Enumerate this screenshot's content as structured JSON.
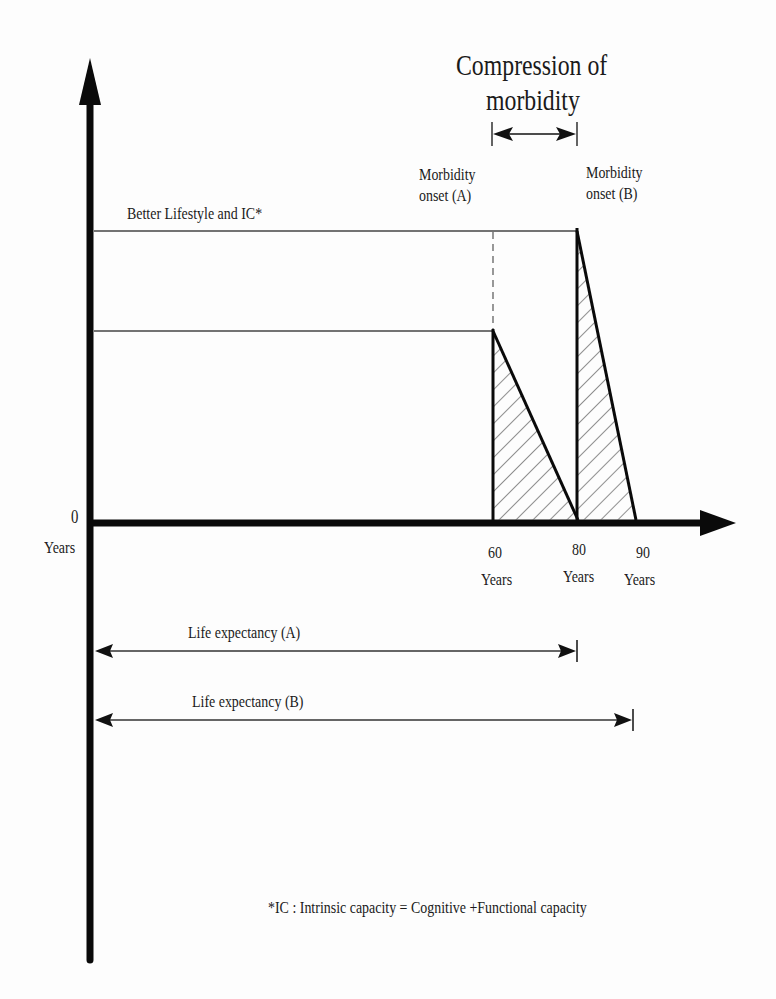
{
  "title": {
    "line1": "Compression of",
    "line2": "morbidity"
  },
  "labels": {
    "better_lifestyle": "Better Lifestyle and IC*",
    "onset_a_line1": "Morbidity",
    "onset_a_line2": "onset (A)",
    "onset_b_line1": "Morbidity",
    "onset_b_line2": "onset (B)",
    "origin_value": "0",
    "origin_unit": "Years",
    "life_expectancy_a": "Life expectancy (A)",
    "life_expectancy_b": "Life expectancy (B)",
    "footnote": "*IC : Intrinsic capacity = Cognitive +Functional capacity"
  },
  "x_ticks": [
    {
      "value": "60",
      "unit": "Years"
    },
    {
      "value": "80",
      "unit": "Years"
    },
    {
      "value": "90",
      "unit": "Years"
    }
  ],
  "colors": {
    "axis": "#0a0a0a",
    "line": "#333333",
    "hatch": "#555555",
    "background": "#fdfdfd"
  },
  "diagram": {
    "scenario_a": {
      "morbidity_onset_years": 60,
      "life_expectancy_years": 80
    },
    "scenario_b": {
      "morbidity_onset_years": 80,
      "life_expectancy_years": 90
    },
    "compression_span": "60 to 80 years"
  }
}
